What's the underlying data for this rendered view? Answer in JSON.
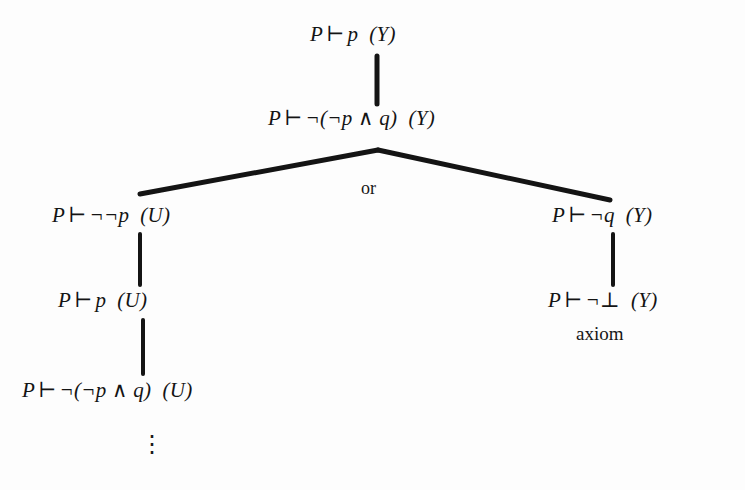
{
  "figure": {
    "type": "proof-search-tree",
    "ink_color": "#141414",
    "background_color": "#fdfdfd"
  },
  "nodes": [
    {
      "id": "root",
      "left": "P",
      "turnstile": "⊢",
      "formula": "p",
      "tag": "(Y)",
      "x": 310,
      "y": 24
    },
    {
      "id": "n2",
      "left": "P",
      "turnstile": "⊢",
      "formula": "¬(¬p ∧ q)",
      "tag": "(Y)",
      "x": 268,
      "y": 108
    },
    {
      "id": "left1",
      "left": "P",
      "turnstile": "⊢",
      "formula": "¬¬p",
      "tag": "(U)",
      "x": 52,
      "y": 205
    },
    {
      "id": "right1",
      "left": "P",
      "turnstile": "⊢",
      "formula": "¬q",
      "tag": "(Y)",
      "x": 552,
      "y": 205
    },
    {
      "id": "left2",
      "left": "P",
      "turnstile": "⊢",
      "formula": "p",
      "tag": "(U)",
      "x": 58,
      "y": 290
    },
    {
      "id": "right2",
      "left": "P",
      "turnstile": "⊢",
      "formula": "¬⊥",
      "tag": "(Y)",
      "x": 548,
      "y": 290
    },
    {
      "id": "left3",
      "left": "P",
      "turnstile": "⊢",
      "formula": "¬(¬p ∧ q)",
      "tag": "(U)",
      "x": 22,
      "y": 380
    }
  ],
  "annotations": {
    "or_label": "or",
    "or_x": 361,
    "or_y": 178,
    "axiom_label": "axiom",
    "axiom_x": 576,
    "axiom_y": 323,
    "ellipsis": "⋮",
    "ellipsis_x": 140,
    "ellipsis_y": 432
  },
  "edges": [
    {
      "name": "root-to-n2",
      "x1": 377,
      "y1": 56,
      "x2": 377,
      "y2": 104,
      "width": 5
    },
    {
      "name": "n2-to-left1-fork",
      "x1": 378,
      "y1": 150,
      "x2": 140,
      "y2": 194,
      "width": 5
    },
    {
      "name": "n2-to-right1-fork",
      "x1": 378,
      "y1": 150,
      "x2": 610,
      "y2": 200,
      "width": 5
    },
    {
      "name": "left1-to-left2",
      "x1": 140,
      "y1": 234,
      "x2": 140,
      "y2": 285,
      "width": 4
    },
    {
      "name": "right1-to-right2",
      "x1": 613,
      "y1": 234,
      "x2": 613,
      "y2": 285,
      "width": 4
    },
    {
      "name": "left2-to-left3",
      "x1": 143,
      "y1": 320,
      "x2": 143,
      "y2": 374,
      "width": 4
    }
  ]
}
